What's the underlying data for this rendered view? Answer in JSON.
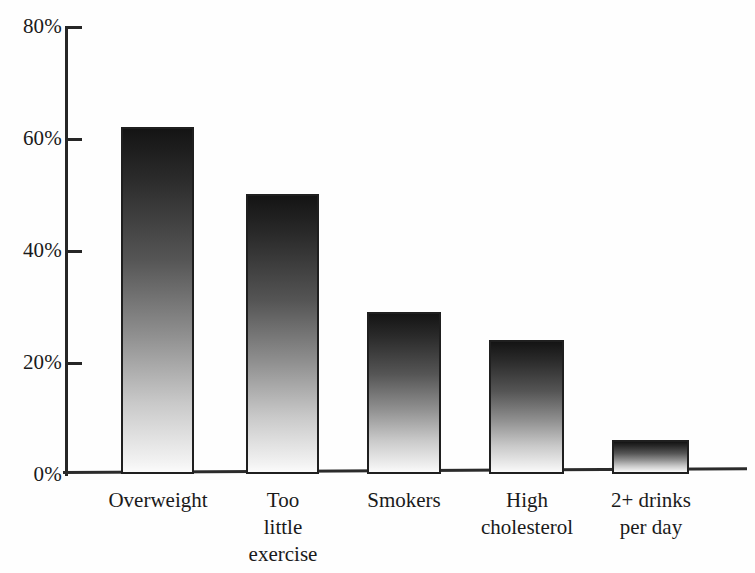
{
  "chart_data": {
    "type": "bar",
    "title": "",
    "subtitle": "",
    "xlabel": "",
    "ylabel": "",
    "categories": [
      "Overweight",
      "Too little exercise",
      "Smokers",
      "High cholesterol",
      "2+ drinks per day"
    ],
    "category_label_lines": [
      [
        "Overweight"
      ],
      [
        "Too",
        "little",
        "exercise"
      ],
      [
        "Smokers"
      ],
      [
        "High",
        "cholesterol"
      ],
      [
        "2+ drinks",
        "per day"
      ]
    ],
    "values": [
      62,
      50,
      29,
      24,
      6
    ],
    "value_labels": [
      "62%",
      "50%",
      "29%",
      "24%",
      "6%"
    ],
    "ylim": [
      0,
      80
    ],
    "ytick_values": [
      0,
      20,
      40,
      60,
      80
    ],
    "ytick_labels": [
      "0%",
      "20%",
      "40%",
      "60%",
      "80%"
    ],
    "grid": false,
    "legend": false,
    "legend_position": "none",
    "bar_fill": "vertical-gradient-dark-to-light",
    "bar_border_color": "#1f1f1f",
    "axis_color": "#262626",
    "background_color": "#ffffff"
  },
  "axis": {
    "y_ticks": [
      {
        "label": "80%",
        "value": 80
      },
      {
        "label": "60%",
        "value": 60
      },
      {
        "label": "40%",
        "value": 40
      },
      {
        "label": "20%",
        "value": 20
      },
      {
        "label": "0%",
        "value": 0
      }
    ]
  },
  "bars": [
    {
      "name": "overweight",
      "label": "Overweight",
      "value": 62
    },
    {
      "name": "too-little-exercise",
      "label": "Too\nlittle\nexercise",
      "value": 50
    },
    {
      "name": "smokers",
      "label": "Smokers",
      "value": 29
    },
    {
      "name": "high-cholesterol",
      "label": "High\ncholesterol",
      "value": 24
    },
    {
      "name": "two-plus-drinks-per-day",
      "label": "2+ drinks\nper day",
      "value": 6
    }
  ]
}
